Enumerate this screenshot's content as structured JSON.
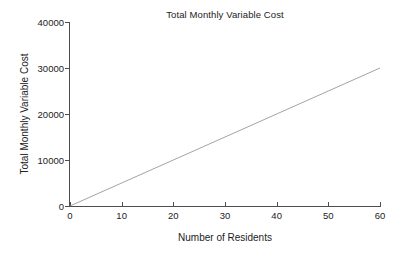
{
  "chart_data": {
    "type": "line",
    "title": "Total Monthly Variable Cost",
    "xlabel": "Number of Residents",
    "ylabel": "Total Monthly Variable Cost",
    "xlim": [
      0,
      60
    ],
    "ylim": [
      0,
      40000
    ],
    "xticks": [
      0,
      10,
      20,
      30,
      40,
      50,
      60
    ],
    "xtick_labels": [
      "0",
      "10",
      "20",
      "30",
      "40",
      "50",
      "60"
    ],
    "yticks": [
      0,
      10000,
      20000,
      30000,
      40000
    ],
    "ytick_labels": [
      "0",
      "10000",
      "20000",
      "30000",
      "40000"
    ],
    "grid": false,
    "legend": null,
    "series": [
      {
        "name": "Total Monthly Variable Cost",
        "color": "#8c8c8c",
        "linewidth": 0.8,
        "marker": "none",
        "slope_per_resident": 500,
        "intercept": 0,
        "x": [
          0,
          10,
          20,
          30,
          40,
          50,
          60
        ],
        "values": [
          0,
          5000,
          10000,
          15000,
          20000,
          25000,
          30000
        ]
      }
    ]
  },
  "style": {
    "background": "#ffffff",
    "axis_color": "#4d4d4d",
    "text_color": "#222222",
    "line_color": "#8c8c8c"
  }
}
